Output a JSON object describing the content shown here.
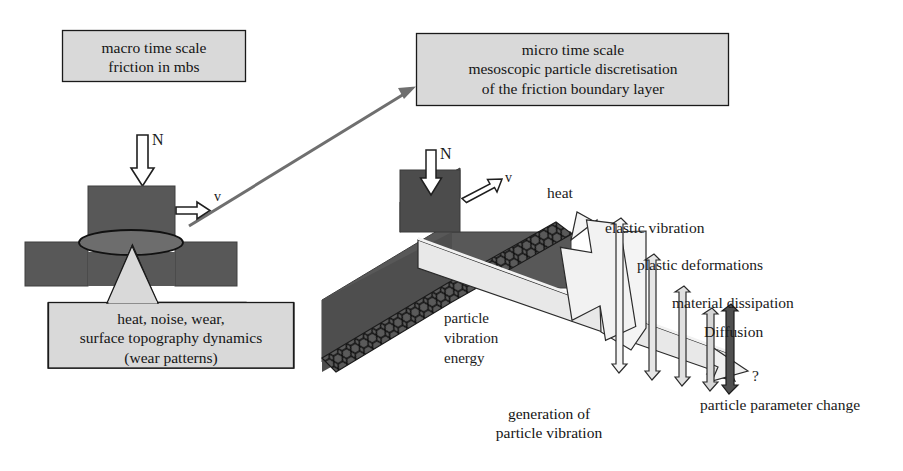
{
  "figure": {
    "title_hidden": "Two-scale friction modelling diagram",
    "background": "#ffffff",
    "colors": {
      "box_fill": "#d9d9d9",
      "box_stroke": "#1a1a1a",
      "dark_body": "#585858",
      "dark_body_shade": "#4a4a4a",
      "light_band": "#e4e4e4",
      "arrow_outline": "#1f1f1f",
      "arrow_fill": "#ffffff",
      "connector": "#6b6b6b",
      "text": "#151515",
      "dark_arrow_fill": "#4f4f4f"
    }
  },
  "boxes": {
    "macro": {
      "label": "macro time scale\nfriction in mbs",
      "lines": [
        "macro time scale",
        "friction in mbs"
      ]
    },
    "micro": {
      "label": "micro time scale\nmesoscopic particle discretisation\nof the friction boundary layer",
      "lines": [
        "micro time scale",
        "mesoscopic particle discretisation",
        "of the friction boundary layer"
      ]
    },
    "outcomes": {
      "label": "heat, noise, wear,\nsurface topography dynamics\n(wear patterns)",
      "lines": [
        "heat, noise, wear,",
        "surface topography dynamics",
        "(wear patterns)"
      ]
    },
    "generation": {
      "label": "generation of\nparticle vibration",
      "lines": [
        "generation of",
        "particle vibration"
      ]
    }
  },
  "macro_diagram": {
    "normal_force_label": "N",
    "velocity_label": "v"
  },
  "micro_diagram": {
    "normal_force_label": "N",
    "velocity_label": "v",
    "band_label": "particle\nvibration\nenergy",
    "band_label_lines": [
      "particle",
      "vibration",
      "energy"
    ],
    "heat_label": "heat"
  },
  "energy_channels": [
    {
      "name": "elastic-vibration",
      "label": "elastic vibration"
    },
    {
      "name": "plastic-deformations",
      "label": "plastic deformations"
    },
    {
      "name": "material-dissipation",
      "label": "material dissipation"
    },
    {
      "name": "diffusion",
      "label": "Diffusion"
    },
    {
      "name": "unknown",
      "label": "?"
    },
    {
      "name": "particle-parameter-change",
      "label": "particle parameter change"
    }
  ],
  "connector": {
    "name": "macro-to-micro-arrow",
    "description": "arrow from macro contact patch to micro time scale box"
  }
}
